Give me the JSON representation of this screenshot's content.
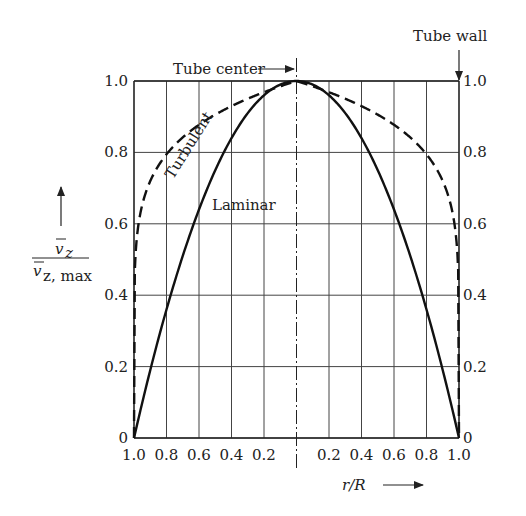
{
  "chart_data": {
    "type": "line",
    "title": "",
    "xlabel": "r/R",
    "ylabel": "v̄z / v̄z, max",
    "ylabel_numerator": "v",
    "ylabel_num_sub": "z",
    "ylabel_denominator": "v",
    "ylabel_den_sub": "z, max",
    "ylim": [
      0,
      1.0
    ],
    "x_ticks_left": [
      "1.0",
      "0.8",
      "0.6",
      "0.4",
      "0.2"
    ],
    "x_ticks_right": [
      "0.2",
      "0.4",
      "0.6",
      "0.8",
      "1.0"
    ],
    "y_ticks": [
      "0",
      "0.2",
      "0.4",
      "0.6",
      "0.8",
      "1.0"
    ],
    "grid": true,
    "annotations": {
      "tube_center": "Tube center",
      "tube_wall": "Tube wall"
    },
    "series": [
      {
        "name": "Laminar",
        "style": "solid",
        "x_signed_rR": [
          -1.0,
          -0.8,
          -0.6,
          -0.4,
          -0.2,
          0.0,
          0.2,
          0.4,
          0.6,
          0.8,
          1.0
        ],
        "values": [
          0.0,
          0.36,
          0.64,
          0.84,
          0.96,
          1.0,
          0.96,
          0.84,
          0.64,
          0.36,
          0.0
        ]
      },
      {
        "name": "Turbulent",
        "style": "dashed",
        "x_signed_rR": [
          -1.0,
          -0.98,
          -0.95,
          -0.9,
          -0.8,
          -0.6,
          -0.4,
          -0.2,
          0.0,
          0.2,
          0.4,
          0.6,
          0.8,
          0.9,
          0.95,
          0.98,
          1.0
        ],
        "values": [
          0.0,
          0.57,
          0.65,
          0.72,
          0.79,
          0.88,
          0.93,
          0.97,
          1.0,
          0.97,
          0.93,
          0.88,
          0.79,
          0.72,
          0.65,
          0.57,
          0.0
        ]
      }
    ]
  }
}
